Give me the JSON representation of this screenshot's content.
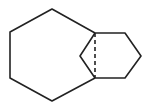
{
  "diagram": {
    "stroke_color": "#222222",
    "background": "#ffffff",
    "nodes": {
      "a": [
        95,
        33
      ],
      "b": [
        52,
        9
      ],
      "c": [
        10,
        32
      ],
      "d": [
        10,
        78
      ],
      "e": [
        52,
        101
      ],
      "f": [
        95,
        78
      ],
      "g": [
        125,
        33
      ],
      "h": [
        141,
        56
      ],
      "i": [
        125,
        78
      ],
      "j": [
        80,
        56
      ]
    },
    "large_ring": [
      "a",
      "b",
      "c",
      "d",
      "e",
      "f"
    ],
    "small_ring_right": [
      "a",
      "g",
      "h",
      "i",
      "f"
    ],
    "bridge_left": [
      "a",
      "j",
      "f"
    ],
    "dashed_bond": [
      "a",
      "f"
    ]
  }
}
